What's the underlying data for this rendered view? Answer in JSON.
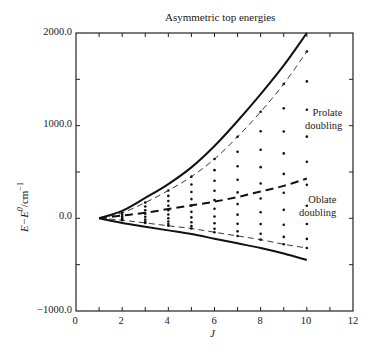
{
  "chart_data": {
    "type": "line",
    "title": "Asymmetric top energies",
    "xlabel": "J",
    "ylabel": "E−E⁰/cm⁻¹",
    "xlim": [
      0,
      12
    ],
    "ylim": [
      -1000,
      2000
    ],
    "x_ticks": [
      "0",
      "2",
      "4",
      "6",
      "8",
      "10",
      "12"
    ],
    "y_ticks": [
      "2000.0",
      "1000.0",
      "0.0",
      "−1000.0"
    ],
    "grid": false,
    "x": [
      1,
      2,
      3,
      4,
      5,
      6,
      7,
      8,
      9,
      10
    ],
    "series": [
      {
        "name": "Prolate limit (solid)",
        "style": "solid-thick",
        "values": [
          0,
          80,
          220,
          370,
          550,
          780,
          1050,
          1340,
          1650,
          2000
        ]
      },
      {
        "name": "Upper asymmetric level (dashed)",
        "style": "dashed-thin",
        "values": [
          0,
          60,
          170,
          300,
          450,
          640,
          880,
          1150,
          1450,
          1800
        ]
      },
      {
        "name": "Middle levels (dashed)",
        "style": "dashed-thick",
        "values": [
          0,
          30,
          60,
          100,
          140,
          180,
          230,
          290,
          350,
          430
        ]
      },
      {
        "name": "Lower asymmetric level (dashed)",
        "style": "dashed-thin",
        "values": [
          0,
          -20,
          -50,
          -80,
          -110,
          -150,
          -190,
          -230,
          -280,
          -320
        ]
      },
      {
        "name": "Oblate limit (solid)",
        "style": "solid-thick",
        "values": [
          0,
          -50,
          -90,
          -130,
          -170,
          -220,
          -270,
          -320,
          -380,
          -450
        ]
      }
    ],
    "annotations": [
      {
        "text": "Prolate doubling",
        "x": 11.5,
        "y": 950
      },
      {
        "text": "Oblate doubling",
        "x": 11.5,
        "y": 10
      }
    ]
  },
  "labels": {
    "title": "Asymmetric top energies",
    "ylabel_main": "E−E",
    "ylabel_sup": "0",
    "ylabel_unit": "/cm",
    "ylabel_unit_sup": "−1",
    "xlabel": "J",
    "yticks": [
      "2000.0",
      "1000.0",
      "0.0",
      "−1000.0"
    ],
    "xticks": [
      "0",
      "2",
      "4",
      "6",
      "8",
      "10",
      "12"
    ],
    "prolate_1": "Prolate",
    "prolate_2": "doubling",
    "oblate_1": "Oblate",
    "oblate_2": "doubling"
  }
}
